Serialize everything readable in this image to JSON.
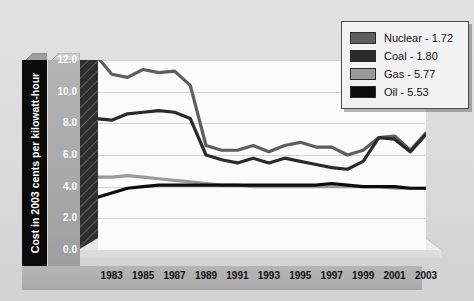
{
  "chart_data": {
    "type": "line",
    "title": "",
    "xlabel": "",
    "ylabel": "Cost in 2003 cents per kilowatt-hour",
    "xlim": [
      1982,
      2003
    ],
    "ylim": [
      0.0,
      12.0
    ],
    "grid": true,
    "legend_position": "top-right",
    "y_ticks": [
      "0.0",
      "2.0",
      "4.0",
      "6.0",
      "8.0",
      "10.0",
      "12.0"
    ],
    "y_tick_values": [
      0.0,
      2.0,
      4.0,
      6.0,
      8.0,
      10.0,
      12.0
    ],
    "x_ticks": [
      "1983",
      "1985",
      "1987",
      "1989",
      "1991",
      "1993",
      "1995",
      "1997",
      "1999",
      "2001",
      "2003"
    ],
    "x_tick_values": [
      1983,
      1985,
      1987,
      1989,
      1991,
      1993,
      1995,
      1997,
      1999,
      2001,
      2003
    ],
    "x": [
      1982,
      1983,
      1984,
      1985,
      1986,
      1987,
      1988,
      1989,
      1990,
      1991,
      1992,
      1993,
      1994,
      1995,
      1996,
      1997,
      1998,
      1999,
      2000,
      2001,
      2002,
      2003
    ],
    "series": [
      {
        "name": "Nuclear",
        "final_value": 1.72,
        "color": "#5e5e5e",
        "values": [
          12.3,
          11.1,
          10.9,
          11.4,
          11.2,
          11.3,
          10.4,
          6.6,
          6.3,
          6.3,
          6.6,
          6.2,
          6.6,
          6.8,
          6.5,
          6.5,
          6.0,
          6.3,
          7.1,
          7.2,
          6.3,
          7.4
        ]
      },
      {
        "name": "Coal",
        "final_value": 1.8,
        "color": "#2b2b2b",
        "values": [
          8.3,
          8.2,
          8.6,
          8.7,
          8.8,
          8.7,
          8.3,
          6.0,
          5.7,
          5.5,
          5.8,
          5.5,
          5.8,
          5.6,
          5.4,
          5.2,
          5.1,
          5.6,
          7.1,
          7.0,
          6.2,
          7.3
        ]
      },
      {
        "name": "Gas",
        "final_value": 5.77,
        "color": "#9a9a9a",
        "values": [
          4.6,
          4.6,
          4.7,
          4.6,
          4.5,
          4.4,
          4.3,
          4.2,
          4.1,
          4.1,
          4.0,
          4.0,
          4.0,
          4.0,
          4.0,
          4.0,
          4.0,
          4.0,
          4.0,
          3.9,
          3.9,
          3.9
        ]
      },
      {
        "name": "Oil",
        "final_value": 5.53,
        "color": "#0c0c0c",
        "values": [
          3.3,
          3.6,
          3.9,
          4.0,
          4.1,
          4.1,
          4.1,
          4.1,
          4.1,
          4.1,
          4.1,
          4.1,
          4.1,
          4.1,
          4.1,
          4.2,
          4.1,
          4.0,
          4.0,
          4.0,
          3.9,
          3.9
        ]
      }
    ],
    "legend": [
      {
        "label": "Nuclear - 1.72",
        "color": "#5e5e5e"
      },
      {
        "label": "Coal - 1.80",
        "color": "#2b2b2b"
      },
      {
        "label": "Gas - 5.77",
        "color": "#9a9a9a"
      },
      {
        "label": "Oil - 5.53",
        "color": "#0c0c0c"
      }
    ]
  },
  "colors": {
    "canvas": "#dcdcdc",
    "plot_background": "#fbfbfb",
    "gridline": "#d2d2d2",
    "axis_band": "#a9a9a9",
    "axis_title_strip": "#0b0b0b",
    "axis_title_text": "#ffffff",
    "legend_background": "#f2f2f2",
    "legend_border": "#4a4a4a",
    "wall": "#2e2e2e",
    "floor": "#ececec"
  }
}
